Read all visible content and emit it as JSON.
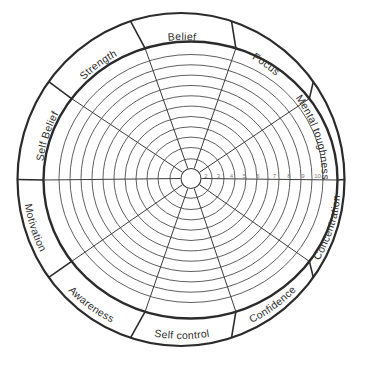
{
  "wheel": {
    "description": "Blank coaching performance wheel with ten labelled sectors and a 1-10 scoring grid",
    "segments": [
      {
        "label": "Belief"
      },
      {
        "label": "Focus"
      },
      {
        "label": "Mental toughness"
      },
      {
        "label": "Concentration"
      },
      {
        "label": "Confidence"
      },
      {
        "label": "Self control"
      },
      {
        "label": "Awareness"
      },
      {
        "label": "Motivation"
      },
      {
        "label": "Self Belief"
      },
      {
        "label": "Strength"
      }
    ],
    "scale_ticks": [
      "2",
      "3",
      "4",
      "5",
      "6",
      "7",
      "8",
      "9",
      "10"
    ],
    "ring_count": 11,
    "colors": {
      "outline": "#2b2b2b",
      "grid": "#4d4d4d",
      "tick": "#7d7d7d",
      "background": "#ffffff"
    }
  }
}
